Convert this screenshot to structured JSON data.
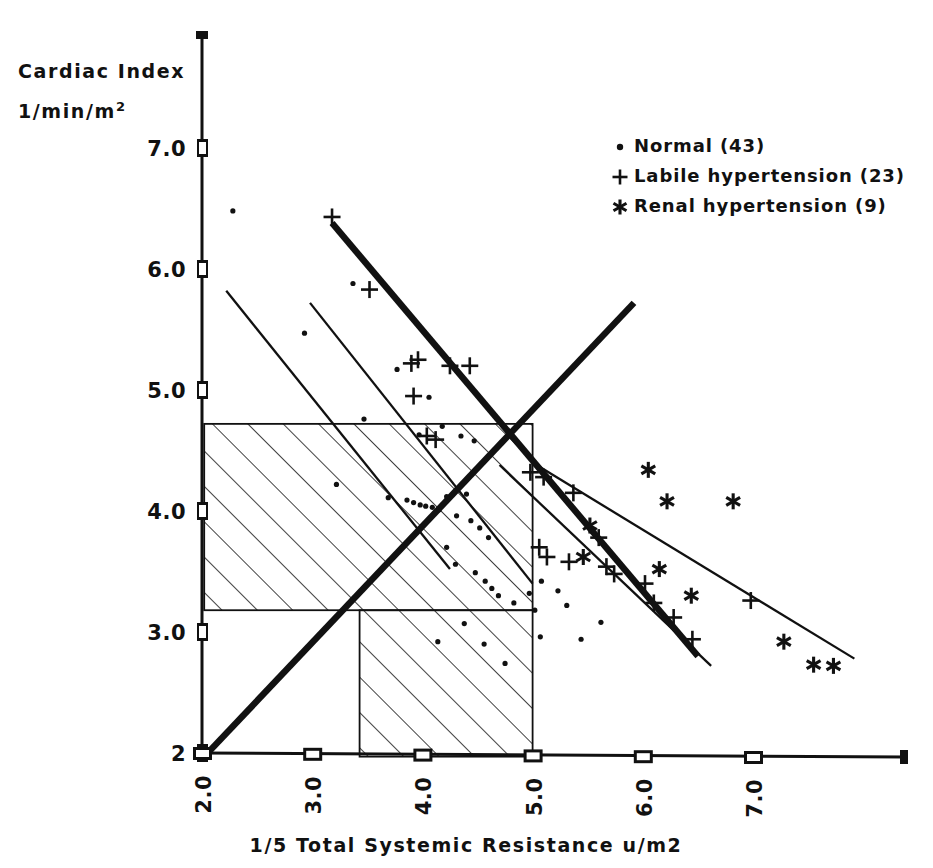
{
  "chart_data": {
    "type": "scatter",
    "title": "",
    "xlabel": "1/5 Total Systemic Resistance  u/m2",
    "ylabel_line1": "Cardiac Index",
    "ylabel_line2": "1/min/m",
    "ylabel_line2_sup": "2",
    "xlim": [
      2.0,
      7.9
    ],
    "ylim": [
      1.85,
      7.45
    ],
    "grid": false,
    "xticks": [
      "2.0",
      "3.0",
      "4.0",
      "5.0",
      "6.0",
      "7.0"
    ],
    "xtick_values": [
      2.0,
      3.0,
      4.0,
      5.0,
      6.0,
      7.0
    ],
    "yticks": [
      "7.0",
      "6.0",
      "5.0",
      "4.0",
      "3.0",
      "2"
    ],
    "ytick_values": [
      7.0,
      6.0,
      5.0,
      4.0,
      3.0,
      2.0
    ],
    "legend_position": "top-right",
    "legend": [
      {
        "marker": "dot",
        "label": "Normal (43)",
        "count": 43
      },
      {
        "marker": "plus",
        "label": "Labile hypertension (23)",
        "count": 23
      },
      {
        "marker": "asterisk",
        "label": "Renal hypertension (9)",
        "count": 9
      }
    ],
    "series": [
      {
        "name": "Normal (43)",
        "marker": "dot",
        "count": 43,
        "points": [
          [
            2.28,
            6.48
          ],
          [
            3.37,
            5.88
          ],
          [
            2.93,
            5.47
          ],
          [
            3.77,
            5.17
          ],
          [
            4.06,
            4.94
          ],
          [
            3.47,
            4.76
          ],
          [
            3.97,
            4.63
          ],
          [
            4.18,
            4.7
          ],
          [
            4.35,
            4.62
          ],
          [
            4.47,
            4.58
          ],
          [
            3.22,
            4.22
          ],
          [
            3.69,
            4.11
          ],
          [
            3.86,
            4.09
          ],
          [
            3.92,
            4.07
          ],
          [
            3.98,
            4.05
          ],
          [
            4.03,
            4.04
          ],
          [
            4.09,
            4.03
          ],
          [
            4.15,
            4.01
          ],
          [
            4.22,
            4.12
          ],
          [
            4.31,
            3.96
          ],
          [
            4.4,
            4.14
          ],
          [
            4.44,
            3.92
          ],
          [
            4.52,
            3.86
          ],
          [
            4.6,
            3.78
          ],
          [
            4.22,
            3.7
          ],
          [
            4.3,
            3.56
          ],
          [
            4.48,
            3.49
          ],
          [
            4.57,
            3.42
          ],
          [
            4.63,
            3.36
          ],
          [
            4.69,
            3.3
          ],
          [
            4.83,
            3.24
          ],
          [
            4.97,
            3.32
          ],
          [
            5.02,
            3.18
          ],
          [
            5.08,
            3.42
          ],
          [
            5.23,
            3.34
          ],
          [
            5.07,
            2.96
          ],
          [
            4.56,
            2.9
          ],
          [
            4.38,
            3.07
          ],
          [
            4.14,
            2.92
          ],
          [
            5.44,
            2.94
          ],
          [
            5.62,
            3.08
          ],
          [
            5.31,
            3.22
          ],
          [
            4.75,
            2.74
          ]
        ]
      },
      {
        "name": "Labile hypertension (23)",
        "marker": "plus",
        "count": 23,
        "points": [
          [
            3.18,
            6.43
          ],
          [
            3.52,
            5.83
          ],
          [
            3.9,
            5.22
          ],
          [
            3.96,
            5.25
          ],
          [
            4.25,
            5.2
          ],
          [
            4.43,
            5.2
          ],
          [
            3.92,
            4.95
          ],
          [
            4.04,
            4.62
          ],
          [
            4.12,
            4.59
          ],
          [
            4.98,
            4.32
          ],
          [
            5.1,
            4.28
          ],
          [
            5.37,
            4.15
          ],
          [
            5.06,
            3.7
          ],
          [
            5.6,
            3.78
          ],
          [
            5.13,
            3.62
          ],
          [
            5.33,
            3.58
          ],
          [
            5.67,
            3.54
          ],
          [
            5.74,
            3.48
          ],
          [
            6.02,
            3.4
          ],
          [
            6.1,
            3.24
          ],
          [
            6.28,
            3.12
          ],
          [
            6.45,
            2.94
          ],
          [
            6.98,
            3.26
          ]
        ]
      },
      {
        "name": "Renal hypertension (9)",
        "marker": "asterisk",
        "count": 9,
        "points": [
          [
            6.05,
            4.34
          ],
          [
            6.22,
            4.08
          ],
          [
            6.82,
            4.08
          ],
          [
            5.52,
            3.88
          ],
          [
            5.46,
            3.62
          ],
          [
            6.15,
            3.52
          ],
          [
            6.44,
            3.3
          ],
          [
            7.28,
            2.92
          ],
          [
            7.55,
            2.73
          ],
          [
            7.73,
            2.72
          ]
        ]
      }
    ],
    "regression_lines": [
      {
        "name": "normal-upper-line",
        "style": "thin",
        "x1": 2.22,
        "y1": 5.82,
        "x2": 4.25,
        "y2": 3.52
      },
      {
        "name": "normal-lower-line",
        "style": "thin",
        "x1": 2.98,
        "y1": 5.72,
        "x2": 5.0,
        "y2": 3.4
      },
      {
        "name": "labile-line",
        "style": "thin",
        "x1": 4.7,
        "y1": 4.38,
        "x2": 6.62,
        "y2": 2.72
      },
      {
        "name": "renal-line",
        "style": "thin",
        "x1": 5.0,
        "y1": 4.4,
        "x2": 7.92,
        "y2": 2.78
      }
    ],
    "identity_lines": [
      {
        "name": "ascending-isobar",
        "style": "thick",
        "x1": 2.02,
        "y1": 1.97,
        "x2": 5.92,
        "y2": 5.72
      },
      {
        "name": "descending-isobar",
        "style": "thick",
        "x1": 3.18,
        "y1": 6.38,
        "x2": 6.5,
        "y2": 2.8
      }
    ],
    "shaded_regions": [
      {
        "name": "upper-normal-range-box",
        "x1": 2.02,
        "x2": 5.0,
        "y1": 3.18,
        "y2": 4.72,
        "hatch": "diagonal-45"
      },
      {
        "name": "lower-normal-range-box",
        "x1": 3.43,
        "x2": 5.0,
        "y1": 1.97,
        "y2": 3.18,
        "hatch": "diagonal-45"
      }
    ]
  }
}
